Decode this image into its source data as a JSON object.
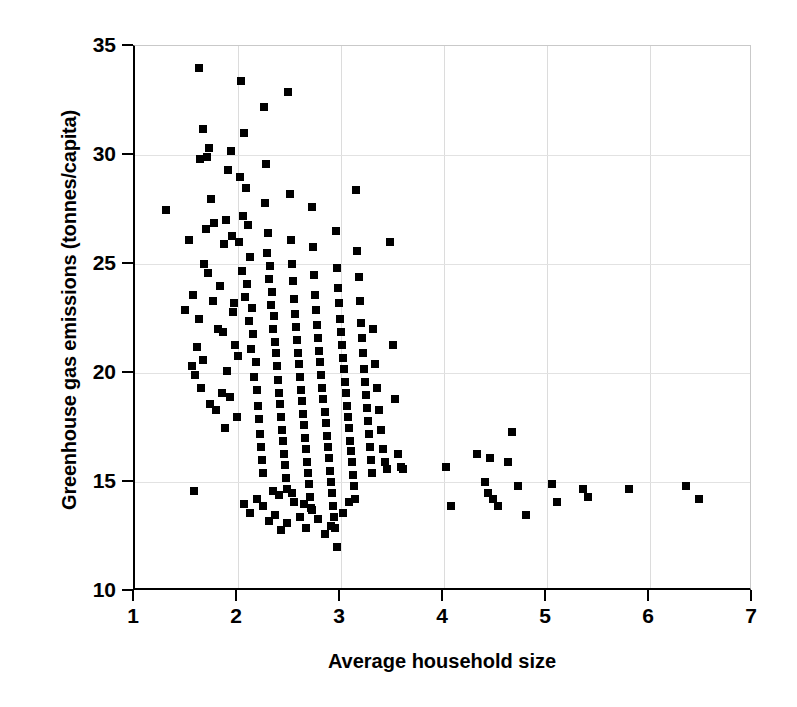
{
  "chart_data": {
    "type": "scatter",
    "title": "",
    "xlabel": "Average household size",
    "ylabel": "Greenhouse gas emissions (tonnes/capita)",
    "xlim": [
      1,
      7
    ],
    "ylim": [
      10,
      35
    ],
    "xticks": [
      1,
      2,
      3,
      4,
      5,
      6,
      7
    ],
    "yticks": [
      10,
      15,
      20,
      25,
      30,
      35
    ],
    "grid": true,
    "grid_color": "#dcdcdc",
    "marker": "square",
    "marker_color": "#000000",
    "marker_size_px": 8,
    "legend": null,
    "series": [
      {
        "name": "Households",
        "points": [
          [
            1.3,
            27.5
          ],
          [
            1.62,
            34.0
          ],
          [
            1.57,
            14.6
          ],
          [
            1.66,
            31.2
          ],
          [
            1.63,
            29.8
          ],
          [
            1.7,
            29.9
          ],
          [
            1.72,
            30.3
          ],
          [
            1.69,
            26.6
          ],
          [
            1.67,
            25.0
          ],
          [
            1.74,
            28.0
          ],
          [
            1.76,
            23.3
          ],
          [
            1.62,
            22.5
          ],
          [
            1.6,
            21.2
          ],
          [
            1.58,
            19.9
          ],
          [
            1.64,
            19.3
          ],
          [
            1.73,
            18.6
          ],
          [
            1.79,
            18.3
          ],
          [
            1.71,
            24.6
          ],
          [
            1.77,
            26.9
          ],
          [
            1.66,
            20.6
          ],
          [
            1.81,
            22.0
          ],
          [
            1.84,
            19.1
          ],
          [
            1.56,
            23.6
          ],
          [
            1.88,
            27.0
          ],
          [
            1.9,
            29.3
          ],
          [
            1.93,
            30.2
          ],
          [
            1.86,
            25.9
          ],
          [
            1.83,
            24.0
          ],
          [
            1.95,
            22.8
          ],
          [
            1.97,
            21.3
          ],
          [
            1.89,
            20.1
          ],
          [
            1.92,
            18.9
          ],
          [
            1.99,
            18.0
          ],
          [
            1.87,
            17.5
          ],
          [
            1.94,
            26.3
          ],
          [
            1.96,
            23.2
          ],
          [
            1.85,
            21.9
          ],
          [
            2.0,
            20.8
          ],
          [
            2.03,
            33.4
          ],
          [
            2.06,
            31.0
          ],
          [
            2.02,
            29.0
          ],
          [
            2.08,
            28.5
          ],
          [
            2.05,
            27.2
          ],
          [
            2.1,
            26.8
          ],
          [
            2.01,
            26.0
          ],
          [
            2.12,
            25.3
          ],
          [
            2.04,
            24.7
          ],
          [
            2.09,
            24.1
          ],
          [
            2.07,
            23.5
          ],
          [
            2.14,
            23.0
          ],
          [
            2.11,
            22.4
          ],
          [
            2.15,
            21.8
          ],
          [
            2.13,
            21.1
          ],
          [
            2.17,
            20.5
          ],
          [
            2.16,
            19.8
          ],
          [
            2.18,
            19.2
          ],
          [
            2.19,
            18.5
          ],
          [
            2.2,
            17.9
          ],
          [
            2.21,
            17.2
          ],
          [
            2.22,
            16.6
          ],
          [
            2.23,
            16.0
          ],
          [
            2.24,
            15.4
          ],
          [
            2.25,
            32.2
          ],
          [
            2.27,
            29.6
          ],
          [
            2.26,
            27.8
          ],
          [
            2.29,
            26.4
          ],
          [
            2.28,
            25.5
          ],
          [
            2.31,
            24.9
          ],
          [
            2.3,
            24.3
          ],
          [
            2.33,
            23.7
          ],
          [
            2.32,
            23.1
          ],
          [
            2.35,
            22.6
          ],
          [
            2.34,
            22.0
          ],
          [
            2.36,
            21.4
          ],
          [
            2.37,
            20.9
          ],
          [
            2.38,
            20.3
          ],
          [
            2.39,
            19.7
          ],
          [
            2.4,
            19.1
          ],
          [
            2.41,
            18.6
          ],
          [
            2.42,
            18.0
          ],
          [
            2.43,
            17.4
          ],
          [
            2.44,
            16.9
          ],
          [
            2.45,
            16.3
          ],
          [
            2.46,
            15.8
          ],
          [
            2.47,
            15.2
          ],
          [
            2.48,
            14.7
          ],
          [
            2.49,
            32.9
          ],
          [
            2.5,
            28.2
          ],
          [
            2.51,
            26.1
          ],
          [
            2.52,
            25.0
          ],
          [
            2.53,
            24.2
          ],
          [
            2.54,
            23.4
          ],
          [
            2.55,
            22.7
          ],
          [
            2.56,
            22.1
          ],
          [
            2.57,
            21.5
          ],
          [
            2.58,
            20.9
          ],
          [
            2.59,
            20.4
          ],
          [
            2.6,
            19.8
          ],
          [
            2.61,
            19.2
          ],
          [
            2.62,
            18.7
          ],
          [
            2.63,
            18.1
          ],
          [
            2.64,
            17.6
          ],
          [
            2.65,
            17.0
          ],
          [
            2.66,
            16.5
          ],
          [
            2.67,
            15.9
          ],
          [
            2.68,
            15.4
          ],
          [
            2.69,
            14.9
          ],
          [
            2.7,
            14.3
          ],
          [
            2.71,
            13.8
          ],
          [
            2.72,
            27.6
          ],
          [
            2.73,
            25.8
          ],
          [
            2.74,
            24.5
          ],
          [
            2.75,
            23.6
          ],
          [
            2.76,
            22.9
          ],
          [
            2.77,
            22.2
          ],
          [
            2.78,
            21.6
          ],
          [
            2.79,
            21.0
          ],
          [
            2.8,
            20.5
          ],
          [
            2.81,
            19.9
          ],
          [
            2.82,
            19.3
          ],
          [
            2.83,
            18.8
          ],
          [
            2.84,
            18.2
          ],
          [
            2.85,
            17.7
          ],
          [
            2.86,
            17.1
          ],
          [
            2.87,
            16.6
          ],
          [
            2.88,
            16.1
          ],
          [
            2.89,
            15.5
          ],
          [
            2.9,
            15.0
          ],
          [
            2.91,
            14.5
          ],
          [
            2.92,
            13.9
          ],
          [
            2.93,
            13.4
          ],
          [
            2.94,
            12.9
          ],
          [
            2.95,
            26.5
          ],
          [
            2.96,
            24.8
          ],
          [
            2.97,
            23.9
          ],
          [
            2.98,
            23.2
          ],
          [
            2.99,
            22.5
          ],
          [
            3.0,
            21.9
          ],
          [
            3.01,
            21.3
          ],
          [
            3.02,
            20.7
          ],
          [
            3.03,
            20.2
          ],
          [
            3.04,
            19.6
          ],
          [
            3.05,
            19.1
          ],
          [
            3.06,
            18.5
          ],
          [
            3.07,
            18.0
          ],
          [
            3.08,
            17.5
          ],
          [
            3.09,
            16.9
          ],
          [
            3.1,
            16.4
          ],
          [
            3.11,
            15.9
          ],
          [
            3.12,
            15.3
          ],
          [
            3.13,
            14.8
          ],
          [
            3.14,
            14.2
          ],
          [
            3.15,
            28.4
          ],
          [
            3.16,
            25.6
          ],
          [
            3.17,
            24.4
          ],
          [
            3.18,
            23.3
          ],
          [
            3.19,
            22.3
          ],
          [
            3.2,
            21.6
          ],
          [
            3.21,
            20.9
          ],
          [
            3.22,
            20.2
          ],
          [
            3.23,
            19.6
          ],
          [
            3.24,
            19.0
          ],
          [
            3.25,
            18.4
          ],
          [
            3.26,
            17.8
          ],
          [
            3.27,
            17.2
          ],
          [
            3.28,
            16.6
          ],
          [
            3.29,
            16.0
          ],
          [
            3.3,
            15.4
          ],
          [
            3.31,
            22.0
          ],
          [
            3.33,
            20.4
          ],
          [
            3.35,
            19.3
          ],
          [
            3.37,
            18.3
          ],
          [
            3.39,
            17.4
          ],
          [
            3.41,
            16.5
          ],
          [
            3.43,
            15.9
          ],
          [
            3.45,
            15.6
          ],
          [
            3.48,
            26.0
          ],
          [
            3.5,
            21.3
          ],
          [
            3.52,
            18.8
          ],
          [
            3.55,
            16.3
          ],
          [
            3.58,
            15.7
          ],
          [
            3.6,
            15.6
          ],
          [
            2.06,
            14.0
          ],
          [
            2.12,
            13.6
          ],
          [
            2.18,
            14.2
          ],
          [
            2.24,
            13.9
          ],
          [
            2.3,
            13.2
          ],
          [
            2.36,
            13.5
          ],
          [
            2.42,
            12.8
          ],
          [
            2.48,
            13.1
          ],
          [
            2.54,
            14.1
          ],
          [
            2.6,
            13.4
          ],
          [
            2.66,
            12.9
          ],
          [
            2.72,
            13.7
          ],
          [
            2.78,
            13.3
          ],
          [
            2.84,
            12.6
          ],
          [
            2.9,
            13.0
          ],
          [
            2.96,
            12.0
          ],
          [
            2.34,
            14.6
          ],
          [
            2.4,
            14.4
          ],
          [
            2.52,
            14.5
          ],
          [
            2.64,
            14.0
          ],
          [
            3.02,
            13.6
          ],
          [
            3.08,
            14.1
          ],
          [
            1.52,
            26.1
          ],
          [
            1.49,
            22.9
          ],
          [
            1.55,
            20.3
          ],
          [
            4.02,
            15.7
          ],
          [
            4.07,
            13.9
          ],
          [
            4.32,
            16.3
          ],
          [
            4.45,
            16.1
          ],
          [
            4.4,
            15.0
          ],
          [
            4.43,
            14.5
          ],
          [
            4.48,
            14.2
          ],
          [
            4.52,
            13.9
          ],
          [
            4.66,
            17.3
          ],
          [
            4.62,
            15.9
          ],
          [
            4.72,
            14.8
          ],
          [
            4.8,
            13.5
          ],
          [
            5.05,
            14.9
          ],
          [
            5.1,
            14.1
          ],
          [
            5.35,
            14.7
          ],
          [
            5.4,
            14.3
          ],
          [
            5.8,
            14.7
          ],
          [
            6.35,
            14.8
          ],
          [
            6.48,
            14.2
          ]
        ]
      }
    ]
  }
}
